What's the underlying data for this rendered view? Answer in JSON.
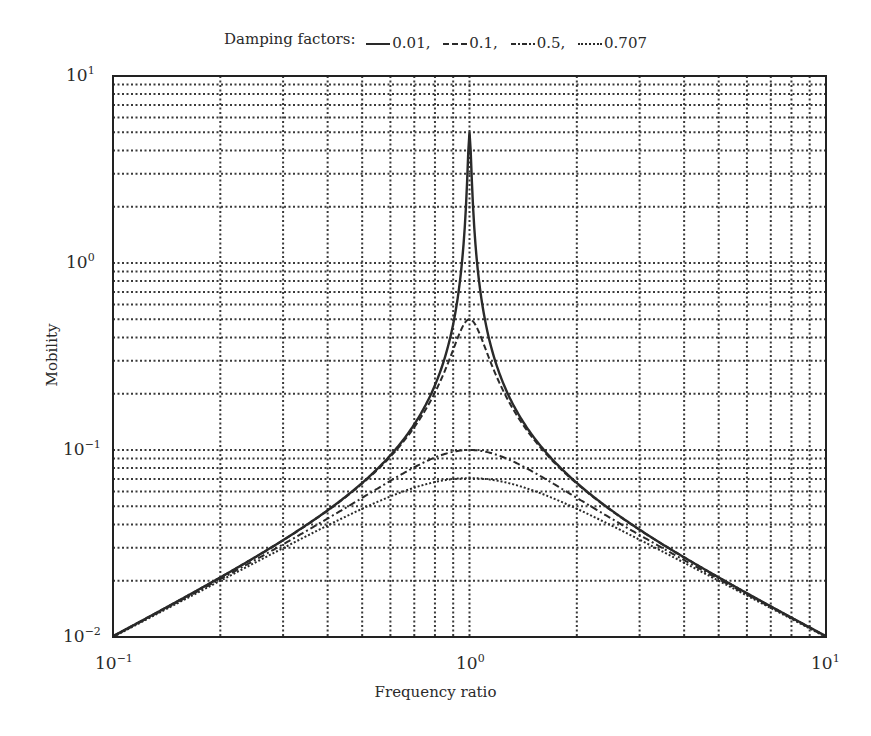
{
  "chart_data": {
    "type": "line",
    "title": "",
    "legend": {
      "title": "Damping factors:",
      "position": "top",
      "entries": [
        {
          "label": "0.01,",
          "style": "solid"
        },
        {
          "label": "0.1,",
          "style": "dashed"
        },
        {
          "label": "0.5,",
          "style": "dashdot"
        },
        {
          "label": "0.707",
          "style": "dotted"
        }
      ]
    },
    "xlabel": "Frequency ratio",
    "ylabel": "Mobility",
    "xscale": "log",
    "yscale": "log",
    "xlim": [
      0.1,
      10
    ],
    "ylim": [
      0.01,
      10
    ],
    "grid": true,
    "x_ticks": [
      {
        "base": "10",
        "exp": "−1",
        "value": 0.1
      },
      {
        "base": "10",
        "exp": "0",
        "value": 1
      },
      {
        "base": "10",
        "exp": "1",
        "value": 10
      }
    ],
    "y_ticks": [
      {
        "base": "10",
        "exp": "−2",
        "value": 0.01
      },
      {
        "base": "10",
        "exp": "−1",
        "value": 0.1
      },
      {
        "base": "10",
        "exp": "0",
        "value": 1
      },
      {
        "base": "10",
        "exp": "1",
        "value": 10
      }
    ],
    "x": [
      0.1,
      0.15,
      0.2,
      0.3,
      0.4,
      0.5,
      0.6,
      0.7,
      0.8,
      0.9,
      0.95,
      0.98,
      1.0,
      1.02,
      1.05,
      1.1,
      1.2,
      1.5,
      2,
      3,
      4,
      5,
      6,
      7,
      8,
      10
    ],
    "series": [
      {
        "name": "0.01",
        "style": "solid",
        "values": [
          0.0101,
          0.0153,
          0.0208,
          0.033,
          0.0476,
          0.0667,
          0.0937,
          0.137,
          0.222,
          0.473,
          0.972,
          2.16,
          5.0,
          2.19,
          1.02,
          0.523,
          0.272,
          0.12,
          0.0667,
          0.0375,
          0.0267,
          0.0208,
          0.0171,
          0.0146,
          0.0127,
          0.0101
        ]
      },
      {
        "name": "0.1",
        "style": "dashed",
        "values": [
          0.0101,
          0.0153,
          0.0208,
          0.0329,
          0.0474,
          0.0661,
          0.0918,
          0.13,
          0.197,
          0.329,
          0.427,
          0.485,
          0.5,
          0.484,
          0.419,
          0.311,
          0.2,
          0.109,
          0.0658,
          0.0373,
          0.0266,
          0.0207,
          0.0171,
          0.0146,
          0.0127,
          0.0101
        ]
      },
      {
        "name": "0.5",
        "style": "dashdot",
        "values": [
          0.0101,
          0.0151,
          0.02,
          0.0302,
          0.0402,
          0.0496,
          0.0581,
          0.0653,
          0.0707,
          0.0741,
          0.0748,
          0.075,
          0.1,
          0.099,
          0.0976,
          0.0953,
          0.088,
          0.0718,
          0.0555,
          0.0351,
          0.0256,
          0.0202,
          0.0168,
          0.0143,
          0.0125,
          0.0099
        ]
      },
      {
        "name": "0.707",
        "style": "dotted",
        "values": [
          0.01,
          0.0149,
          0.0196,
          0.0286,
          0.0366,
          0.0433,
          0.0486,
          0.0527,
          0.0556,
          0.0576,
          0.0582,
          0.0585,
          0.0707,
          0.0707,
          0.0706,
          0.0703,
          0.0692,
          0.0637,
          0.0537,
          0.0349,
          0.0256,
          0.0203,
          0.0169,
          0.0144,
          0.0125,
          0.0099
        ]
      }
    ]
  },
  "plot_area": {
    "left": 113,
    "right": 826,
    "top": 76,
    "bottom": 637
  },
  "colors": {
    "line": "#2a2a2a",
    "grid": "#3a3a3a",
    "axis": "#222222",
    "background": "#ffffff"
  }
}
